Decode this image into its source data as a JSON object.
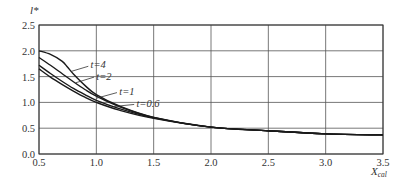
{
  "chart_data": {
    "type": "line",
    "title": "",
    "xlabel": "X_cal",
    "xlabel_main": "X",
    "xlabel_sub": "cal",
    "ylabel": "l*",
    "xlim": [
      0.5,
      3.5
    ],
    "ylim": [
      0.0,
      2.5
    ],
    "xticks": [
      "0.5",
      "1.0",
      "1.5",
      "2.0",
      "2.5",
      "3.0",
      "3.5"
    ],
    "yticks": [
      "0.0",
      "0.5",
      "1.0",
      "1.5",
      "2.0",
      "2.5"
    ],
    "grid": true,
    "legend": "inline annotations",
    "series": [
      {
        "name": "t=4",
        "x": [
          0.5,
          0.6,
          0.7,
          0.75,
          0.8,
          0.9,
          1.0,
          1.2,
          1.5,
          2.0,
          2.5,
          3.0,
          3.5
        ],
        "y": [
          2.0,
          1.93,
          1.8,
          1.68,
          1.55,
          1.33,
          1.15,
          0.93,
          0.71,
          0.52,
          0.45,
          0.39,
          0.37
        ]
      },
      {
        "name": "t=2",
        "x": [
          0.5,
          0.6,
          0.7,
          0.8,
          0.9,
          1.0,
          1.2,
          1.5,
          2.0,
          2.5,
          3.0,
          3.5
        ],
        "y": [
          1.87,
          1.72,
          1.56,
          1.4,
          1.25,
          1.12,
          0.92,
          0.71,
          0.52,
          0.45,
          0.39,
          0.37
        ]
      },
      {
        "name": "t=1",
        "x": [
          0.5,
          0.6,
          0.7,
          0.8,
          0.9,
          1.0,
          1.2,
          1.5,
          2.0,
          2.5,
          3.0,
          3.5
        ],
        "y": [
          1.72,
          1.56,
          1.41,
          1.27,
          1.15,
          1.04,
          0.88,
          0.7,
          0.52,
          0.45,
          0.39,
          0.37
        ]
      },
      {
        "name": "t=0.6",
        "x": [
          0.5,
          0.6,
          0.7,
          0.8,
          0.9,
          1.0,
          1.2,
          1.5,
          2.0,
          2.5,
          3.0,
          3.5
        ],
        "y": [
          1.65,
          1.49,
          1.35,
          1.22,
          1.1,
          1.0,
          0.85,
          0.69,
          0.52,
          0.45,
          0.39,
          0.37
        ]
      }
    ],
    "annotations": [
      {
        "text": "t=4",
        "x": 0.95,
        "y": 1.72
      },
      {
        "text": "t=2",
        "x": 1.0,
        "y": 1.5
      },
      {
        "text": "t=1",
        "x": 1.2,
        "y": 1.2
      },
      {
        "text": "t=0.6",
        "x": 1.35,
        "y": 0.97
      }
    ]
  }
}
